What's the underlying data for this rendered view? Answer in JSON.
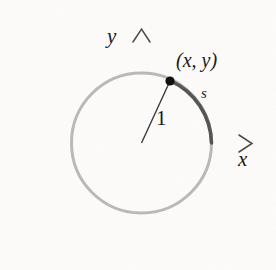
{
  "figure": {
    "background_color": "#fdfcfa",
    "axes": {
      "x_axis_label": "x",
      "y_axis_label": "y",
      "axis_color": "#4a4a4a",
      "x_axis_start": 28,
      "x_axis_end": 252,
      "y_axis_top": 29,
      "y_axis_bottom": 259,
      "origin_x": 141.5,
      "origin_y": 143,
      "arrowhead_style": "open-v"
    },
    "circle": {
      "center_x": 141.5,
      "center_y": 143,
      "radius": 70,
      "stroke_color": "#b9b9b9",
      "stroke_width": 3
    },
    "arc": {
      "label": "s",
      "start_angle_deg": 0,
      "end_angle_deg": 65,
      "stroke_color": "#555555",
      "stroke_width": 3.6
    },
    "radius_segment": {
      "label": "1",
      "stroke_color": "#3a3a3a",
      "stroke_width": 1.4,
      "from_x": 141.5,
      "from_y": 143,
      "to_x": 170,
      "to_y": 81
    },
    "point": {
      "label": "(x, y)",
      "x": 170,
      "y": 81,
      "dot_radius": 4.6,
      "dot_color": "#111111"
    }
  }
}
